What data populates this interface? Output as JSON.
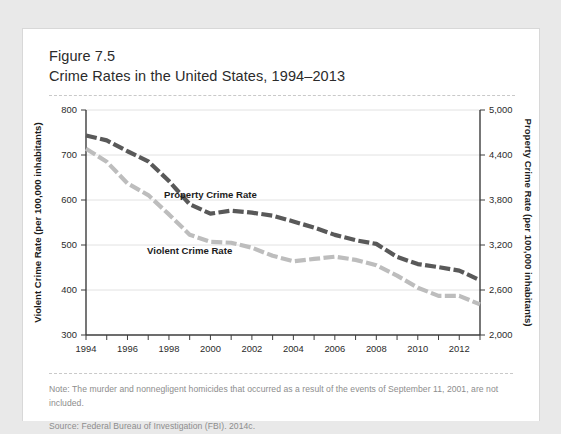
{
  "figure": {
    "number": "Figure 7.5",
    "title": "Crime Rates in the United States, 1994–2013"
  },
  "footer": {
    "note": "Note: The murder and nonnegligent homicides that occurred as a result of the events of September 11, 2001, are not included.",
    "source": "Source: Federal Bureau of Investigation (FBI). 2014c."
  },
  "colors": {
    "property_line": "#595959",
    "violent_line": "#bdbdbd",
    "grid": "#e2e2e2",
    "axis": "#3d3d3d",
    "text": "#2b2b2b",
    "card_background": "#ffffff",
    "page_background": "#e9e9e9"
  },
  "chart_data": {
    "type": "line",
    "title": "Crime Rates in the United States, 1994–2013",
    "xlabel": "",
    "ylabel": "Violent Crime Rate (per 100,000 inhabitants)",
    "y2label": "Property Crime Rate (per 100,000 inhabitants)",
    "grid": true,
    "legend_position": "inline-labels",
    "x": [
      1994,
      1995,
      1996,
      1997,
      1998,
      1999,
      2000,
      2001,
      2002,
      2003,
      2004,
      2005,
      2006,
      2007,
      2008,
      2009,
      2010,
      2011,
      2012,
      2013
    ],
    "xtick_labels": [
      "1994",
      "1996",
      "1998",
      "2000",
      "2002",
      "2004",
      "2006",
      "2008",
      "2010",
      "2012"
    ],
    "xtick_values": [
      1994,
      1996,
      1998,
      2000,
      2002,
      2004,
      2006,
      2008,
      2010,
      2012
    ],
    "xlim": [
      1994,
      2013
    ],
    "ylim": [
      300,
      800
    ],
    "ytick_labels": [
      "300",
      "400",
      "500",
      "600",
      "700",
      "800"
    ],
    "ytick_values": [
      300,
      400,
      500,
      600,
      700,
      800
    ],
    "y2lim": [
      2000,
      5000
    ],
    "y2tick_labels": [
      "2,000",
      "2,600",
      "3,200",
      "3,800",
      "4,400",
      "5,000"
    ],
    "y2tick_values": [
      2000,
      2600,
      3200,
      3800,
      4400,
      5000
    ],
    "series": [
      {
        "name": "Property Crime Rate",
        "axis": "right",
        "color": "#595959",
        "style": "dashed",
        "label_x": 2000,
        "values": [
          4660,
          4595,
          4450,
          4316,
          4053,
          3744,
          3618,
          3658,
          3631,
          3591,
          3514,
          3432,
          3335,
          3264,
          3215,
          3041,
          2946,
          2905,
          2859,
          2731
        ]
      },
      {
        "name": "Violent Crime Rate",
        "axis": "left",
        "color": "#bdbdbd",
        "style": "dashed",
        "label_x": 1999,
        "values": [
          714,
          685,
          637,
          611,
          568,
          523,
          507,
          505,
          494,
          476,
          464,
          469,
          474,
          467,
          455,
          432,
          405,
          387,
          387,
          368
        ]
      }
    ]
  }
}
